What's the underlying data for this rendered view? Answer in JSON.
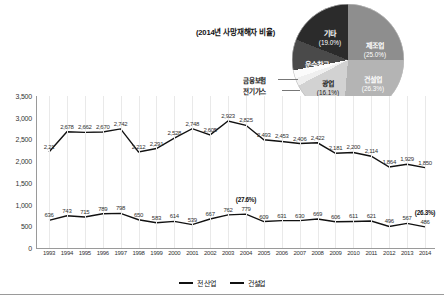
{
  "pie": {
    "title": "(2014년 사망재해자 비율)",
    "inside_labels": [
      {
        "name": "제조업",
        "pct": "(25.0%)"
      },
      {
        "name": "건설업",
        "pct": "(26.3%)"
      },
      {
        "name": "광업",
        "pct": "(16.1%)"
      },
      {
        "name": "기타",
        "pct": "(19.0%)"
      },
      {
        "name": "운수창고",
        "pct": ""
      }
    ],
    "outside_labels": [
      "금융보험",
      "전기가스",
      "농림어업"
    ]
  },
  "legend": {
    "items": [
      {
        "label": "전 산업",
        "color": "#111111"
      },
      {
        "label": "건설업",
        "color": "#111111"
      }
    ]
  },
  "chart_data": {
    "type": "line",
    "title": "",
    "xlabel": "",
    "ylabel": "",
    "ylim": [
      0,
      3500
    ],
    "yticks": [
      "0",
      "500",
      "1,000",
      "1,500",
      "2,000",
      "2,500",
      "3,000",
      "3,500"
    ],
    "grid": "vertical",
    "legend_position": "bottom",
    "categories": [
      "1993",
      "1994",
      "1995",
      "1996",
      "1997",
      "1998",
      "1999",
      "2000",
      "2001",
      "2002",
      "2003",
      "2004",
      "2005",
      "2006",
      "2007",
      "2008",
      "2009",
      "2010",
      "2011",
      "2012",
      "2013",
      "2014"
    ],
    "series": [
      {
        "name": "전 산업",
        "values": [
          2210,
          2678,
          2662,
          2670,
          2742,
          2212,
          2291,
          2528,
          2748,
          2605,
          2923,
          2825,
          2493,
          2453,
          2406,
          2422,
          2181,
          2200,
          2114,
          1864,
          1929,
          1850
        ],
        "labels": [
          "2,21",
          "2,678",
          "2,662",
          "2,670",
          "2,742",
          "2,212",
          "2,291",
          "2,528",
          "2,748",
          "2,605",
          "2,923",
          "2,825",
          "2,493",
          "2,453",
          "2,406",
          "2,422",
          "2,181",
          "2,200",
          "2,114",
          "1,864",
          "1,929",
          "1,850"
        ]
      },
      {
        "name": "건설업",
        "values": [
          636,
          743,
          715,
          789,
          798,
          650,
          583,
          614,
          539,
          667,
          762,
          779,
          609,
          631,
          630,
          669,
          606,
          611,
          621,
          496,
          567,
          486
        ],
        "labels": [
          "636",
          "743",
          "715",
          "789",
          "798",
          "650",
          "583",
          "614",
          "539",
          "667",
          "762",
          "779",
          "609",
          "631",
          "630",
          "669",
          "606",
          "611",
          "621",
          "496",
          "567",
          "486"
        ]
      }
    ],
    "annotations": [
      {
        "text": "(27.6%)",
        "series": "건설업",
        "category": "2004"
      },
      {
        "text": "(26.3%)",
        "series": "건설업",
        "category": "2014"
      }
    ]
  }
}
